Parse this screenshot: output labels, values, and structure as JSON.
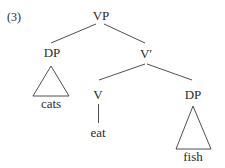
{
  "example_number": "(3)",
  "tree": {
    "root": "VP",
    "subject": {
      "label": "DP",
      "terminal": "cats"
    },
    "vbar": {
      "label": "V′",
      "head": {
        "label": "V",
        "terminal": "eat"
      },
      "object": {
        "label": "DP",
        "terminal": "fish"
      }
    }
  },
  "colors": {
    "line": "#3a3a3a",
    "text": "#2a2a2a",
    "background": "#ffffff"
  }
}
